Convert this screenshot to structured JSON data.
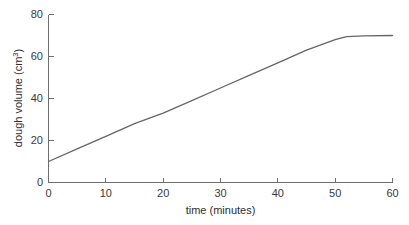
{
  "chart_data": {
    "type": "line",
    "title": "",
    "xlabel": "time (minutes)",
    "ylabel": "dough volume (cm3)",
    "ylabel_base": "dough volume (cm",
    "ylabel_sup": "3",
    "ylabel_close": ")",
    "xlim": [
      0,
      60
    ],
    "ylim": [
      0,
      80
    ],
    "xticks": [
      0,
      10,
      20,
      30,
      40,
      50,
      60
    ],
    "yticks": [
      0,
      20,
      40,
      60,
      80
    ],
    "xtick_labels": [
      "0",
      "10",
      "20",
      "30",
      "40",
      "50",
      "60"
    ],
    "ytick_labels": [
      "0",
      "20",
      "40",
      "60",
      "80"
    ],
    "grid": false,
    "legend": false,
    "legend_position": "none",
    "line_color": "#666666",
    "axis_color": "#6e6e6e",
    "background_color": "#ffffff",
    "series": [
      {
        "name": "dough volume",
        "x": [
          0,
          5,
          10,
          15,
          20,
          25,
          30,
          35,
          40,
          45,
          50,
          52,
          55,
          60
        ],
        "values": [
          10,
          16,
          22,
          28,
          33,
          39,
          45,
          51,
          57,
          63,
          68,
          69.5,
          69.8,
          70
        ]
      }
    ]
  }
}
